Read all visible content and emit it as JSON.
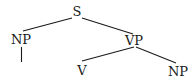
{
  "diagram": {
    "type": "syntax-tree",
    "nodes": {
      "s": {
        "label": "S"
      },
      "np_subject": {
        "label": "NP"
      },
      "vp": {
        "label": "VP"
      },
      "v": {
        "label": "V"
      },
      "np_object": {
        "label": "NP"
      }
    },
    "edges": [
      {
        "from": "S",
        "to": "NP"
      },
      {
        "from": "S",
        "to": "VP"
      },
      {
        "from": "NP",
        "to": "(empty)"
      },
      {
        "from": "VP",
        "to": "V"
      },
      {
        "from": "VP",
        "to": "NP"
      }
    ]
  }
}
